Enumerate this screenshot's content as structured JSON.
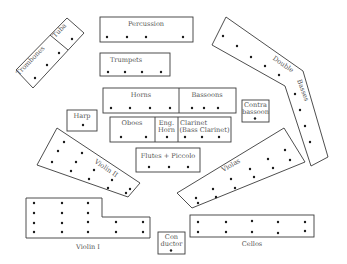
{
  "diagram": {
    "type": "orchestra-seating-chart",
    "sections": {
      "percussion": {
        "label": "Percussion",
        "players": 4
      },
      "trumpets": {
        "label": "Trumpets",
        "players": 4
      },
      "trombones": {
        "label": "Trombones",
        "players": 3
      },
      "tuba": {
        "label": "Tuba",
        "players": 1
      },
      "horns": {
        "label": "Horns",
        "players": 4
      },
      "bassoons": {
        "label": "Bassoons",
        "players": 3
      },
      "contrabassoon": {
        "label_line1": "Contra",
        "label_line2": "bassoon",
        "players": 1
      },
      "double_basses": {
        "label": "Double Basses",
        "label_line1": "Double",
        "label_line2": "Basses",
        "players": 8
      },
      "harp": {
        "label": "Harp",
        "players": 1
      },
      "oboes": {
        "label": "Oboes",
        "players": 2
      },
      "english_horn": {
        "label_line1": "Eng.",
        "label_line2": "Horn",
        "players": 1
      },
      "clarinet": {
        "label_line1": "Clarinet",
        "label_line2": "(Bass Clarinet)",
        "players": 3
      },
      "flutes": {
        "label": "Flutes + Piccolo",
        "players": 3
      },
      "violin_2": {
        "label": "Violin II",
        "players": 14
      },
      "violas": {
        "label": "Violas",
        "players": 12
      },
      "violin_1": {
        "label": "Violin I",
        "players": 16
      },
      "cellos": {
        "label": "Cellos",
        "players": 10
      },
      "conductor": {
        "label_line1": "Con",
        "label_line2": "ductor",
        "players": 1
      }
    }
  }
}
